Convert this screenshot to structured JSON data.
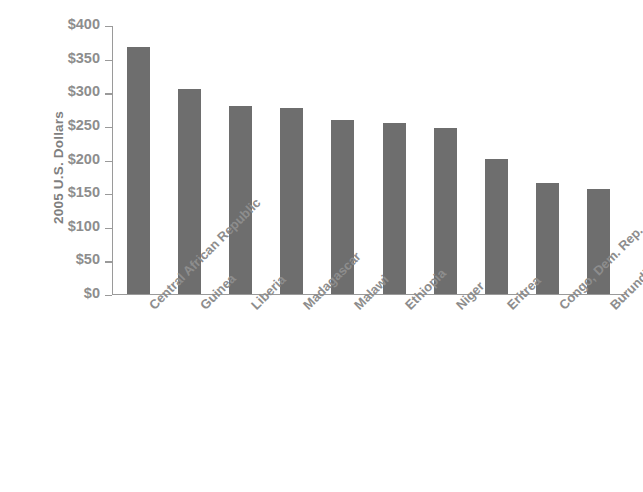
{
  "chart_data": {
    "type": "bar",
    "title": "",
    "xlabel": "",
    "ylabel": "2005 U.S. Dollars",
    "ylim": [
      0,
      400
    ],
    "ytick_labels": [
      "$400",
      "$350",
      "$300",
      "$250",
      "$200",
      "$150",
      "$100",
      "$50",
      "$0"
    ],
    "ytick_values": [
      400,
      350,
      300,
      250,
      200,
      150,
      100,
      50,
      0
    ],
    "grid": false,
    "legend": false,
    "bar_color": "#6e6e6e",
    "axis_color": "#9a9a9a",
    "text_color": "#8d8d8d",
    "background": "#ffffff",
    "categories": [
      "Central African Republic",
      "Guinea",
      "Liberia",
      "Madagascar",
      "Malawi",
      "Ethiopia",
      "Niger",
      "Eritrea",
      "Congo, Dem. Rep.",
      "Burundi"
    ],
    "values": [
      367,
      305,
      279,
      276,
      258,
      254,
      246,
      200,
      165,
      156
    ]
  }
}
